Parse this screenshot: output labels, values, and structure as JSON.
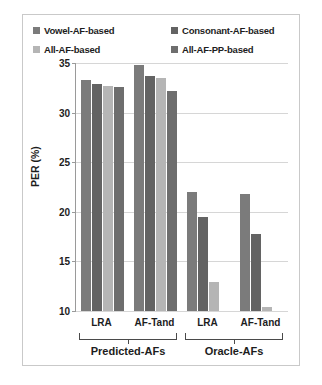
{
  "chart_data": {
    "type": "bar",
    "title": "",
    "xlabel": "",
    "ylabel": "PER (%)",
    "ylim": [
      10,
      35
    ],
    "yticks": [
      10,
      15,
      20,
      25,
      30,
      35
    ],
    "grid": true,
    "legend_position": "top",
    "categories": [
      "LRA",
      "AF-Tand",
      "LRA",
      "AF-Tand"
    ],
    "group_labels": [
      "Predicted-AFs",
      "Oracle-AFs"
    ],
    "groups": [
      {
        "label": "Predicted-AFs",
        "categories": [
          "LRA",
          "AF-Tand"
        ]
      },
      {
        "label": "Oracle-AFs",
        "categories": [
          "LRA",
          "AF-Tand"
        ]
      }
    ],
    "series": [
      {
        "name": "Vowel-AF-based",
        "color": "#7b7b7b",
        "values": [
          33.3,
          34.8,
          22.0,
          21.8
        ]
      },
      {
        "name": "Consonant-AF-based",
        "color": "#636363",
        "values": [
          32.9,
          33.7,
          19.5,
          17.8
        ]
      },
      {
        "name": "All-AF-based",
        "color": "#b5b5b5",
        "values": [
          32.7,
          33.5,
          12.9,
          10.4
        ]
      },
      {
        "name": "All-AF-PP-based",
        "color": "#6e6e6e",
        "values": [
          32.6,
          32.2,
          null,
          null
        ]
      }
    ]
  },
  "legend": {
    "items": [
      {
        "label": "Vowel-AF-based",
        "color": "#7b7b7b"
      },
      {
        "label": "Consonant-AF-based",
        "color": "#636363"
      },
      {
        "label": "All-AF-based",
        "color": "#b5b5b5"
      },
      {
        "label": "All-AF-PP-based",
        "color": "#6e6e6e"
      }
    ]
  },
  "axis": {
    "y_title": "PER (%)",
    "y_ticks": [
      "35",
      "30",
      "25",
      "20",
      "15",
      "10"
    ],
    "x_ticks": [
      "LRA",
      "AF-Tand",
      "LRA",
      "AF-Tand"
    ],
    "x_groups": [
      "Predicted-AFs",
      "Oracle-AFs"
    ]
  }
}
